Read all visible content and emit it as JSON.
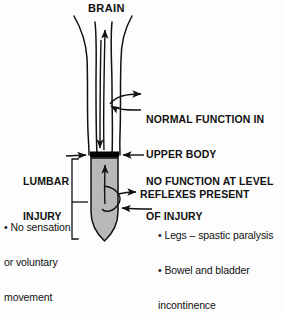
{
  "diagram": {
    "type": "medical-anatomy-diagram",
    "background_color": "#fdfdfd",
    "ink_color": "#111111",
    "cord_fill_color": "#b8b8b8",
    "injury_bar_color": "#000000"
  },
  "labels": {
    "brain": "BRAIN",
    "normal_function_line1": "NORMAL FUNCTION IN",
    "normal_function_line2": "UPPER BODY",
    "lumbar_injury_line1": "LUMBAR",
    "lumbar_injury_line2": "INJURY",
    "no_function_line1": "NO FUNCTION AT LEVEL",
    "no_function_line2": "OF INJURY",
    "reflexes_present": "REFLEXES PRESENT",
    "no_sensation_line1": "• No sensation",
    "no_sensation_line2": "or voluntary",
    "no_sensation_line3": "movement",
    "bullet_legs": "• Legs – spastic paralysis",
    "bullet_bowel_line1": "• Bowel and bladder",
    "bullet_bowel_line2": "incontinence"
  },
  "annotations": {
    "arrow_to_brain": "upward-arrow-toward-brain",
    "arrow_normal_out": "arrow-right-from-cord-upper",
    "arrow_normal_in": "arrow-left-into-cord-upper",
    "arrow_lumbar_pointer": "arrow-right-to-injury-bar",
    "arrow_no_function": "arrow-left-to-injury-bar",
    "arrow_reflex_out": "arrow-right-from-reflex-arc",
    "arrow_reflex_in": "arrow-left-into-reflex-arc",
    "bracket_lower_cord": "bracket-spanning-lower-cord",
    "leader_no_sensation": "leader-line-to-bracket"
  }
}
